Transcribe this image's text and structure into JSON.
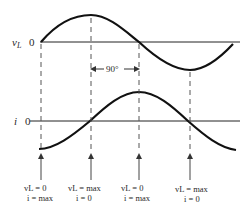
{
  "diagram": {
    "top_waveform": {
      "label": "v",
      "subscript": "L",
      "zero_label": "0"
    },
    "bottom_waveform": {
      "label": "i",
      "zero_label": "0"
    },
    "phase_annotation": "90°",
    "markers": [
      {
        "line1": "vL = 0",
        "line2": "i = max"
      },
      {
        "line1": "vL = max",
        "line2": "i = 0"
      },
      {
        "line1": "vL = 0",
        "line2": "i = max"
      },
      {
        "line1": "vL = max",
        "line2": "i = 0"
      }
    ]
  }
}
